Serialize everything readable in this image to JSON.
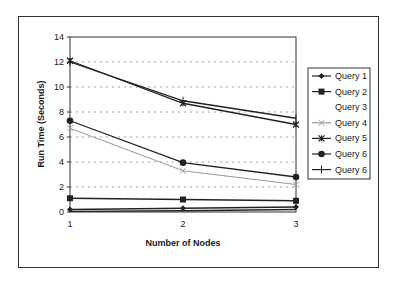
{
  "chart_data": {
    "type": "line",
    "title": "",
    "xlabel": "Number of Nodes",
    "ylabel": "Run Time (Seconds)",
    "x": [
      1,
      2,
      3
    ],
    "categories": [
      "1",
      "2",
      "3"
    ],
    "ylim": [
      0,
      14
    ],
    "yticks": [
      0,
      2,
      4,
      6,
      8,
      10,
      12,
      14
    ],
    "grid": "horizontal dashed",
    "legend_position": "right",
    "series": [
      {
        "name": "Query 1",
        "marker": "diamond",
        "color": "#222222",
        "values": [
          0.2,
          0.3,
          0.4
        ]
      },
      {
        "name": "Query 2",
        "marker": "square",
        "color": "#222222",
        "values": [
          1.1,
          1.0,
          0.9
        ]
      },
      {
        "name": "Query 3",
        "marker": "none",
        "color": "#222222",
        "values": [
          0.05,
          0.1,
          0.2
        ]
      },
      {
        "name": "Query 4",
        "marker": "x",
        "color": "#9a9a9a",
        "values": [
          6.7,
          3.3,
          2.2
        ]
      },
      {
        "name": "Query 5",
        "marker": "star",
        "color": "#222222",
        "values": [
          12.1,
          8.7,
          7.0
        ]
      },
      {
        "name": "Query 6",
        "marker": "circle",
        "color": "#222222",
        "values": [
          7.3,
          3.95,
          2.8
        ]
      },
      {
        "name": "Query 6",
        "marker": "plus",
        "color": "#222222",
        "values": [
          12.0,
          8.9,
          7.5
        ]
      }
    ]
  }
}
